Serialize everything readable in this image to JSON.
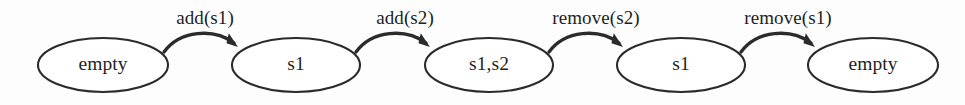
{
  "diagram": {
    "type": "state-transition",
    "canvas": {
      "width": 965,
      "height": 105
    },
    "style": {
      "background_color": "#fdfdfd",
      "stroke_color": "#2b2b2b",
      "text_color": "#1f1f1f",
      "node_fill": "#ffffff"
    },
    "states": [
      {
        "id": "state-empty-start",
        "label": "empty",
        "cx": 103,
        "cy": 65,
        "rx": 65,
        "ry": 27
      },
      {
        "id": "state-s1-first",
        "label": "s1",
        "cx": 296,
        "cy": 65,
        "rx": 64,
        "ry": 27
      },
      {
        "id": "state-s1s2",
        "label": "s1,s2",
        "cx": 489,
        "cy": 65,
        "rx": 64,
        "ry": 27
      },
      {
        "id": "state-s1-second",
        "label": "s1",
        "cx": 681,
        "cy": 65,
        "rx": 64,
        "ry": 27
      },
      {
        "id": "state-empty-end",
        "label": "empty",
        "cx": 873,
        "cy": 65,
        "rx": 65,
        "ry": 27
      }
    ],
    "transitions": [
      {
        "id": "transition-add-s1",
        "label": "add(s1)",
        "from": "state-empty-start",
        "to": "state-s1-first",
        "label_x": 205,
        "label_y": 24,
        "path": "M 164 52 C 180 30, 214 28, 234 43",
        "arrow_tip_x": 238,
        "arrow_tip_y": 47,
        "arrow_angle": 42
      },
      {
        "id": "transition-add-s2",
        "label": "add(s2)",
        "from": "state-s1-first",
        "to": "state-s1s2",
        "label_x": 405,
        "label_y": 24,
        "path": "M 356 52 C 372 30, 406 28, 426 43",
        "arrow_tip_x": 430,
        "arrow_tip_y": 47,
        "arrow_angle": 42
      },
      {
        "id": "transition-remove-s2",
        "label": "remove(s2)",
        "from": "state-s1s2",
        "to": "state-s1-second",
        "label_x": 596,
        "label_y": 24,
        "path": "M 549 52 C 565 30, 599 28, 619 43",
        "arrow_tip_x": 623,
        "arrow_tip_y": 47,
        "arrow_angle": 42
      },
      {
        "id": "transition-remove-s1",
        "label": "remove(s1)",
        "from": "state-s1-second",
        "to": "state-empty-end",
        "label_x": 788,
        "label_y": 24,
        "path": "M 741 52 C 757 30, 791 28, 811 43",
        "arrow_tip_x": 815,
        "arrow_tip_y": 47,
        "arrow_angle": 42
      }
    ]
  }
}
